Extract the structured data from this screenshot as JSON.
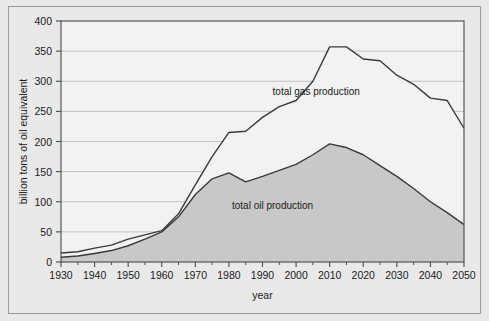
{
  "chart_data": {
    "type": "area",
    "stacked": true,
    "title": "",
    "subtitle": "",
    "xlabel": "year",
    "ylabel": "billion tons of oil equivalent",
    "xlim": [
      1930,
      2050
    ],
    "ylim": [
      0,
      400
    ],
    "xticks": [
      1930,
      1940,
      1950,
      1960,
      1970,
      1980,
      1990,
      2000,
      2010,
      2020,
      2030,
      2040,
      2050
    ],
    "xtick_labels": [
      "1930",
      "1940",
      "1950",
      "1960",
      "1970",
      "1980",
      "1990",
      "2000",
      "2010",
      "2020",
      "2030",
      "2040",
      "2050"
    ],
    "x_minor_tick_step": 5,
    "yticks": [
      0,
      50,
      100,
      150,
      200,
      250,
      300,
      350,
      400
    ],
    "ytick_labels": [
      "0",
      "50",
      "100",
      "150",
      "200",
      "250",
      "300",
      "350",
      "400"
    ],
    "grid": "horizontal",
    "legend_position": "inline-annotations",
    "x": [
      1930,
      1935,
      1940,
      1945,
      1950,
      1955,
      1960,
      1965,
      1970,
      1975,
      1980,
      1985,
      1990,
      1995,
      2000,
      2005,
      2010,
      2015,
      2020,
      2025,
      2030,
      2035,
      2040,
      2045,
      2050
    ],
    "series": [
      {
        "name": "total oil production",
        "label": "total oil production",
        "fill_color": "#c8c8c8",
        "line_color": "#3a3a3a",
        "values": [
          8,
          10,
          14,
          19,
          27,
          38,
          50,
          75,
          112,
          138,
          148,
          133,
          142,
          152,
          162,
          178,
          196,
          190,
          178,
          160,
          142,
          122,
          100,
          82,
          62
        ]
      },
      {
        "name": "total gas production",
        "label": "total gas production",
        "fill_color": "#f2f2f2",
        "line_color": "#3a3a3a",
        "cumulative_values": [
          15,
          17,
          23,
          28,
          38,
          45,
          52,
          80,
          128,
          175,
          215,
          217,
          240,
          258,
          268,
          300,
          357,
          357,
          337,
          334,
          310,
          295,
          272,
          268,
          222
        ]
      }
    ],
    "annotations": [
      {
        "text": "total gas production",
        "x": 2006,
        "y": 278
      },
      {
        "text": "total oil production",
        "x": 1993,
        "y": 88
      }
    ]
  },
  "figure": {
    "background_color": "#e8e8e8",
    "plot_background_color": "#f2f2f2",
    "border_color": "#9a9a9a",
    "axis_color": "#4a4a4a",
    "grid_color": "#b5b5b5"
  }
}
